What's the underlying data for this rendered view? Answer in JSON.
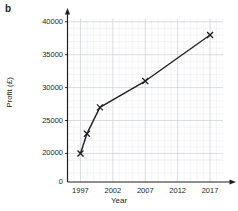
{
  "figure": {
    "part_label": "b"
  },
  "chart_data": {
    "type": "line",
    "title": "",
    "subtitle": "",
    "xlabel": "Year",
    "ylabel": "Profit (£)",
    "x": [
      1997,
      1998,
      2000,
      2007,
      2017
    ],
    "values": [
      20000,
      23000,
      27000,
      31000,
      38000
    ],
    "series": [
      {
        "name": "Profit",
        "x": [
          1997,
          1998,
          2000,
          2007,
          2017
        ],
        "values": [
          20000,
          23000,
          27000,
          31000,
          38000
        ]
      }
    ],
    "xlim": [
      1995,
      2019
    ],
    "ylim": [
      19000,
      40500
    ],
    "xticks": [
      1997,
      2002,
      2007,
      2012,
      2017
    ],
    "xtick_labels": [
      "1997",
      "2002",
      "2007",
      "2012",
      "2017"
    ],
    "yticks": [
      20000,
      25000,
      30000,
      35000,
      40000
    ],
    "ytick_labels": [
      "20000",
      "25000",
      "30000",
      "35000",
      "40000"
    ],
    "y_origin_label": "0",
    "axis_break": true,
    "grid": true,
    "minor_grid": true,
    "legend": "none",
    "marker": "x",
    "line_color": "#231f20",
    "grid_color": "#c8cdd4",
    "minor_grid_color": "#e6e9ee",
    "annotations": []
  }
}
